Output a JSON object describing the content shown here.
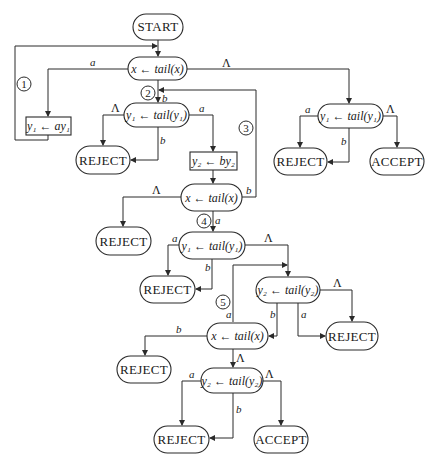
{
  "diagram": {
    "type": "flowchart",
    "nodes": {
      "start": {
        "label": "START"
      },
      "x1": {
        "label": "x ← tail(x)"
      },
      "y1_shift_a": {
        "label": "y₁ ← ay₁"
      },
      "y1_tail_a": {
        "label": "y₁ ← tail(y₁)"
      },
      "reject_1": {
        "label": "REJECT"
      },
      "y2_shift_b": {
        "label": "y₂ ← by₂"
      },
      "y1_tail_right": {
        "label": "y₁ ← tail(y₁)"
      },
      "reject_right": {
        "label": "REJECT"
      },
      "accept_right": {
        "label": "ACCEPT"
      },
      "x2": {
        "label": "x ← tail(x)"
      },
      "reject_2": {
        "label": "REJECT"
      },
      "y1_tail_b": {
        "label": "y₁ ← tail(y₁)"
      },
      "reject_3": {
        "label": "REJECT"
      },
      "y2_tail_a": {
        "label": "y₂ ← tail(y₂)"
      },
      "reject_4": {
        "label": "REJECT"
      },
      "x3": {
        "label": "x ← tail(x)"
      },
      "reject_5": {
        "label": "REJECT"
      },
      "y2_tail_b": {
        "label": "y₂ ← tail(y₂)"
      },
      "reject_6": {
        "label": "REJECT"
      },
      "accept_bottom": {
        "label": "ACCEPT"
      }
    },
    "edge_labels": {
      "x1_a": "a",
      "x1_b": "b",
      "x1_lambda": "Λ",
      "y1a_lambda": "Λ",
      "y1a_b": "b",
      "y1a_a": "a",
      "y1r_a": "a",
      "y1r_b": "b",
      "y1r_lambda": "Λ",
      "x2_lambda": "Λ",
      "x2_b": "b",
      "x2_a": "a",
      "y1b_a": "a",
      "y1b_b": "b",
      "y1b_lambda": "Λ",
      "y2a_b": "b",
      "y2a_a": "a",
      "y2a_lambda": "Λ",
      "x3_a": "a",
      "x3_b": "b",
      "x3_lambda": "Λ",
      "y2b_a": "a",
      "y2b_b": "b",
      "y2b_lambda": "Λ"
    },
    "loop_markers": [
      "1",
      "2",
      "3",
      "4",
      "5"
    ]
  }
}
